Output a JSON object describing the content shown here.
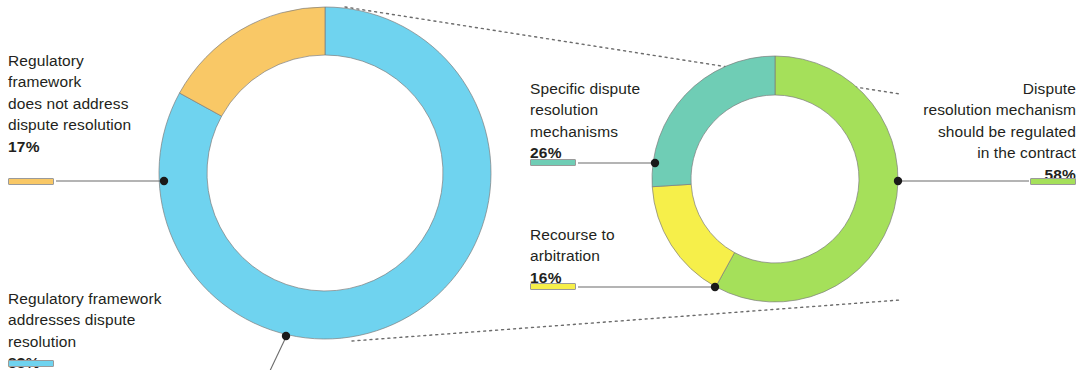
{
  "figure": {
    "type": "two-donut-breakout",
    "background": "#ffffff"
  },
  "colors": {
    "blue": "#6fd3ef",
    "orange": "#f9c866",
    "green": "#a5e05a",
    "teal": "#6fcdb5",
    "yellow": "#f6ef4a",
    "leader_line": "#6b6b6b",
    "dotted_line": "#6b6b6b",
    "text": "#231f20"
  },
  "labels": {
    "left_top": {
      "text": "Regulatory\nframework\ndoes not address\ndispute resolution",
      "percent": "17%",
      "swatch": "#f9c866"
    },
    "left_bottom": {
      "text": "Regulatory framework\naddresses dispute\nresolution",
      "percent": "83%",
      "swatch": "#6fd3ef"
    },
    "mid_top": {
      "text": "Specific dispute\nresolution\nmechanisms",
      "percent": "26%",
      "swatch": "#6fcdb5"
    },
    "mid_bottom": {
      "text": "Recourse to\narbitration",
      "percent": "16%",
      "swatch": "#f6ef4a"
    },
    "right": {
      "text": "Dispute\nresolution mechanism\nshould be regulated\nin the contract",
      "percent": "58%",
      "swatch": "#a5e05a"
    }
  },
  "chart_data": [
    {
      "type": "pie",
      "id": "left-donut",
      "title": "",
      "donut": true,
      "center": [
        325,
        173
      ],
      "outer_radius": 166,
      "inner_radius": 118,
      "start_angle_deg": -90,
      "labels": [
        "Regulatory framework addresses dispute resolution",
        "Regulatory framework does not address dispute resolution"
      ],
      "values": [
        83,
        17
      ],
      "value_unit": "%",
      "colors": [
        "#6fd3ef",
        "#f9c866"
      ]
    },
    {
      "type": "pie",
      "id": "right-donut",
      "title": "",
      "donut": true,
      "center": [
        775,
        179
      ],
      "outer_radius": 123,
      "inner_radius": 84,
      "start_angle_deg": -90,
      "labels": [
        "Dispute resolution mechanism should be regulated in the contract",
        "Recourse to arbitration",
        "Specific dispute resolution mechanisms"
      ],
      "values": [
        58,
        16,
        26
      ],
      "value_unit": "%",
      "colors": [
        "#a5e05a",
        "#f6ef4a",
        "#6fcdb5"
      ]
    }
  ]
}
